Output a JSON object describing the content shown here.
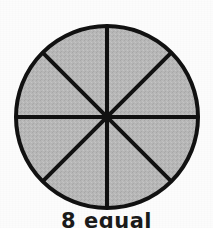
{
  "page": {
    "background_color": "#fcfcfc",
    "width": 213,
    "height": 228
  },
  "figure": {
    "name": "circle-divided-into-eight-equal-sectors",
    "shape": "circle",
    "center_x": 107,
    "center_y": 117,
    "radius": 93,
    "outline_color": "#111111",
    "outline_width": 4,
    "fill_color": "#b8b8b8",
    "divider_color": "#111111",
    "divider_width": 4,
    "sector_count": 8,
    "shaded_sectors": 8,
    "divider_angles_deg": [
      0,
      45,
      90,
      135
    ]
  },
  "caption": {
    "text": "8 equal",
    "color": "#1a1a1a",
    "clipped_at_bottom": true
  }
}
